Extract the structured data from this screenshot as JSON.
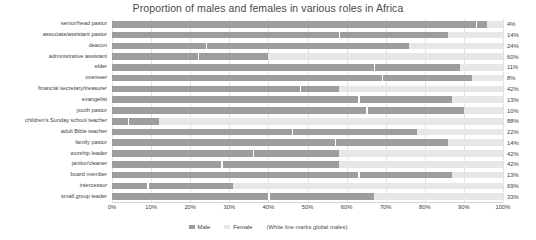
{
  "chart_data": {
    "type": "bar",
    "title": "Proportion of males and females in various roles in Africa",
    "xlabel": "",
    "ylabel": "",
    "xlim": [
      0,
      100
    ],
    "grid": true,
    "orientation": "horizontal",
    "stacked": true,
    "legend_position": "bottom",
    "tick_labels": [
      "0%",
      "10%",
      "20%",
      "30%",
      "40%",
      "50%",
      "60%",
      "70%",
      "80%",
      "90%",
      "100%"
    ],
    "tick_values": [
      0,
      10,
      20,
      30,
      40,
      50,
      60,
      70,
      80,
      90,
      100
    ],
    "legend": [
      {
        "name": "Male",
        "color": "#9d9d9d"
      },
      {
        "name": "Female",
        "color": "#e7e7e7"
      }
    ],
    "legend_note": "(White line marks global males)",
    "marker_note": "White line marks global males",
    "categories": [
      "senior/head pastor",
      "associate/assistant pastor",
      "deacon",
      "administrative assistant",
      "elder",
      "overseer",
      "financial secretary/treasurer",
      "evangelist",
      "youth pastor",
      "children's Sunday school teacher",
      "adult Bible teacher",
      "family pastor",
      "worship leader",
      "janitor/cleaner",
      "board member",
      "intercessor",
      "small group leader"
    ],
    "series": [
      {
        "name": "Male",
        "color": "#9d9d9d",
        "values": [
          96,
          86,
          76,
          40,
          89,
          92,
          58,
          87,
          90,
          12,
          78,
          86,
          58,
          58,
          87,
          31,
          67
        ]
      },
      {
        "name": "Female",
        "color": "#e7e7e7",
        "values": [
          4,
          14,
          24,
          60,
          11,
          8,
          42,
          13,
          10,
          88,
          22,
          14,
          42,
          42,
          13,
          69,
          33
        ]
      }
    ],
    "data_labels": [
      "4%",
      "14%",
      "24%",
      "60%",
      "11%",
      "8%",
      "42%",
      "13%",
      "10%",
      "88%",
      "22%",
      "14%",
      "42%",
      "42%",
      "13%",
      "69%",
      "33%"
    ],
    "global_male_marks": [
      93,
      58,
      24,
      22,
      67,
      69,
      48,
      63,
      65,
      4,
      46,
      57,
      36,
      28,
      63,
      9,
      40
    ]
  }
}
